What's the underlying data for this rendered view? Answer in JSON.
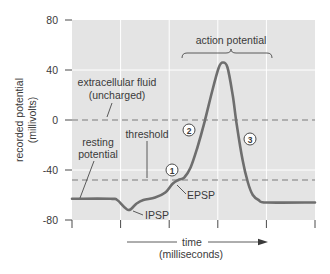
{
  "chart_data": {
    "type": "line",
    "title": "",
    "xlabel": "time (milliseconds)",
    "ylabel": "recorded potential (millivolts)",
    "xlim": [
      0,
      5
    ],
    "ylim": [
      -80,
      80
    ],
    "xticks": [
      0,
      1,
      2,
      3,
      4,
      5
    ],
    "xtick_labels": [],
    "yticks": [
      80,
      40,
      0,
      -40,
      -80
    ],
    "ytick_labels": [
      "80",
      "40",
      "0",
      "-40",
      "-80"
    ],
    "grid": true,
    "legend": "none",
    "series": [
      {
        "name": "membrane potential",
        "x": [
          0,
          0.79,
          0.93,
          1.16,
          1.32,
          1.47,
          1.71,
          1.92,
          2.07,
          2.19,
          2.31,
          2.44,
          2.58,
          2.73,
          2.89,
          3.02,
          3.1,
          3.2,
          3.31,
          3.39,
          3.51,
          3.62,
          3.72,
          3.84,
          4.01,
          5.0
        ],
        "y": [
          -63,
          -63,
          -64,
          -72,
          -67,
          -64,
          -62,
          -58,
          -51,
          -48,
          -46,
          -38,
          -22,
          -1,
          24,
          42,
          46,
          42,
          19,
          -4,
          -32,
          -50,
          -60,
          -64,
          -66,
          -66
        ]
      }
    ],
    "reference_lines": [
      {
        "name": "extracellular fluid (uncharged)",
        "y": 0,
        "style": "dashed"
      },
      {
        "name": "threshold",
        "y": -48,
        "style": "dashed"
      }
    ],
    "annotations": [
      {
        "text": "extracellular fluid"
      },
      {
        "text": "(uncharged)"
      },
      {
        "text": "threshold"
      },
      {
        "text": "resting"
      },
      {
        "text": "potential"
      },
      {
        "text": "action potential"
      },
      {
        "text": "IPSP"
      },
      {
        "text": "EPSP"
      },
      {
        "text": "1"
      },
      {
        "text": "2"
      },
      {
        "text": "3"
      }
    ],
    "axis_titles": {
      "y_line1": "recorded potential",
      "y_line2": "(millivolts)",
      "x_line1": "time",
      "x_line2": "(milliseconds)"
    },
    "colors": {
      "plot_bg": "#e4e4e4",
      "grid": "#ffffff",
      "curve": "#6e6e6e",
      "dashed": "#7a7a7a"
    }
  }
}
